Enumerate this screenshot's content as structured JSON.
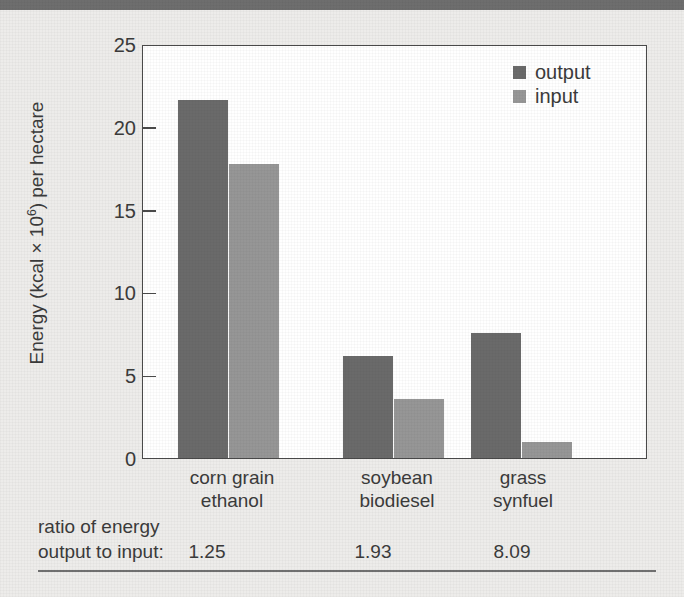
{
  "figure": {
    "background_color": "#edecea",
    "top_rule_color": "#6e6e6e",
    "bottom_rule_color": "#707070"
  },
  "chart_data": {
    "type": "bar",
    "title": "",
    "xlabel": "",
    "ylabel": "Energy (kcal × 10^6) per hectare",
    "ylabel_prefix": "Energy (kcal × 10",
    "ylabel_exponent": "6",
    "ylabel_suffix": ") per hectare",
    "categories": [
      "corn grain ethanol",
      "soybean biodiesel",
      "grass synfuel"
    ],
    "category_lines": [
      {
        "line1": "corn grain",
        "line2": "ethanol"
      },
      {
        "line1": "soybean",
        "line2": "biodiesel"
      },
      {
        "line1": "grass",
        "line2": "synfuel"
      }
    ],
    "series": [
      {
        "name": "output",
        "color": "#6a6a6a",
        "values": [
          21.8,
          6.2,
          7.6
        ]
      },
      {
        "name": "input",
        "color": "#969696",
        "values": [
          17.9,
          3.6,
          1.0
        ]
      }
    ],
    "ylim": [
      0,
      25
    ],
    "yticks": [
      0,
      5,
      10,
      15,
      20,
      25
    ],
    "ytick_labels": [
      "0",
      "5",
      "10",
      "15",
      "20",
      "25"
    ],
    "grid": false,
    "legend_position": "top-right",
    "legend": [
      {
        "label": "output",
        "color": "#6a6a6a"
      },
      {
        "label": "input",
        "color": "#969696"
      }
    ],
    "annotations": {
      "ratio_caption_line1": "ratio of energy",
      "ratio_caption_line2": "output to input:",
      "ratio_values": [
        "1.25",
        "1.93",
        "8.09"
      ]
    }
  }
}
